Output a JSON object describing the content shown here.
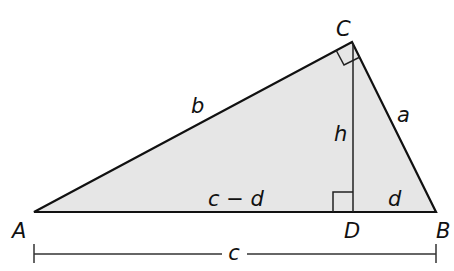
{
  "figure": {
    "type": "right-triangle-altitude",
    "fill_color": "#e6e6e6",
    "stroke_color": "#111111",
    "vertices": {
      "A": {
        "label": "A",
        "x": 34,
        "y": 212
      },
      "B": {
        "label": "B",
        "x": 436,
        "y": 212
      },
      "C": {
        "label": "C",
        "x": 352,
        "y": 42
      },
      "D": {
        "label": "D",
        "x": 353,
        "y": 212
      }
    },
    "side_labels": {
      "a": "a",
      "b": "b",
      "c": "c",
      "h": "h",
      "d": "d",
      "c_minus_d": "c − d"
    },
    "right_angle_marks": [
      "C",
      "D"
    ]
  }
}
